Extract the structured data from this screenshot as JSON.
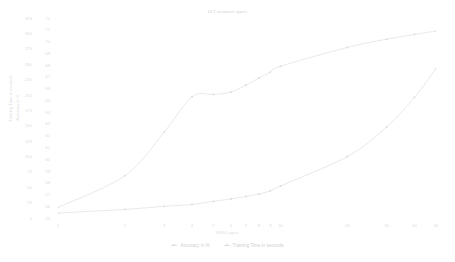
{
  "chart_data": {
    "type": "line",
    "title": "DLT malware types",
    "xlabel": "DNN Layers",
    "ylabel": "Training Time in seconds",
    "y2label": "Accuracy in %",
    "xscale": "log",
    "xlim": [
      1,
      50
    ],
    "ylim": [
      0,
      325
    ],
    "y2lim": [
      55,
      72
    ],
    "grid": false,
    "legend_position": "bottom",
    "x": [
      1,
      2,
      3,
      4,
      5,
      6,
      7,
      8,
      9,
      10,
      20,
      30,
      40,
      50
    ],
    "xticklabels": [
      "1",
      "2",
      "3",
      "4",
      "5",
      "6",
      "7",
      "8",
      "9",
      "10",
      "20",
      "30",
      "40",
      "50"
    ],
    "yticklabels": [
      "0",
      "25",
      "50",
      "75",
      "100",
      "125",
      "150",
      "175",
      "200",
      "225",
      "250",
      "275",
      "300",
      "325"
    ],
    "yticks": [
      0,
      25,
      50,
      75,
      100,
      125,
      150,
      175,
      200,
      225,
      250,
      275,
      300,
      325
    ],
    "y2ticklabels": [
      "55",
      "56",
      "57",
      "58",
      "59",
      "60",
      "61",
      "62",
      "63",
      "64",
      "65",
      "66",
      "67",
      "68",
      "69",
      "70",
      "71",
      "72"
    ],
    "y2ticks": [
      55,
      56,
      57,
      58,
      59,
      60,
      61,
      62,
      63,
      64,
      65,
      66,
      67,
      68,
      69,
      70,
      71,
      72
    ],
    "series": [
      {
        "name": "Accuracy in %",
        "axis": "right",
        "color": "#e0e0e0",
        "marker": "dot",
        "values": [
          55.9,
          58.6,
          62.3,
          65.3,
          65.5,
          65.7,
          66.3,
          66.9,
          67.4,
          67.9,
          69.5,
          70.2,
          70.6,
          70.9
        ]
      },
      {
        "name": "Training Time in seconds",
        "axis": "left",
        "color": "#e0e0e0",
        "marker": "dot",
        "values": [
          8,
          14,
          19,
          22,
          27,
          31,
          35,
          39,
          44,
          52,
          100,
          148,
          196,
          243
        ]
      }
    ]
  },
  "legend": {
    "items": [
      {
        "label": "Accuracy in %"
      },
      {
        "label": "Training Time in seconds"
      }
    ]
  }
}
